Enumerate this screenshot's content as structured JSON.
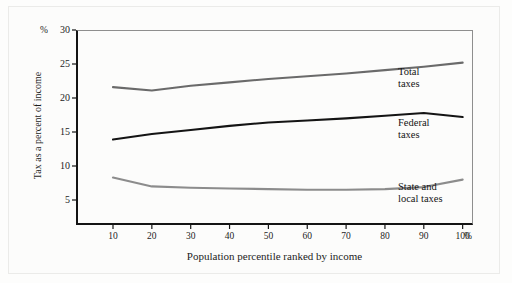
{
  "figure": {
    "background_color": "#fdfdfc",
    "frame_color": "#141414"
  },
  "axes": {
    "y_axis_unit": "%",
    "x_axis_unit": "%",
    "y_title": "Tax as a percent of income",
    "x_title": "Population percentile ranked by income",
    "y_ticks": [
      "30",
      "25",
      "20",
      "15",
      "10",
      "5"
    ],
    "x_ticks": [
      "10",
      "20",
      "30",
      "40",
      "50",
      "60",
      "70",
      "80",
      "90",
      "100"
    ]
  },
  "series_labels": {
    "total": "Total\ntaxes",
    "federal": "Federal\ntaxes",
    "state_local": "State and\nlocal taxes"
  },
  "chart_data": {
    "type": "line",
    "title": "",
    "xlabel": "Population percentile ranked by income",
    "ylabel": "Tax as a percent of income",
    "x": [
      10,
      20,
      30,
      40,
      50,
      60,
      70,
      80,
      90,
      100
    ],
    "xlim": [
      0,
      110
    ],
    "ylim": [
      0,
      30
    ],
    "yticks": [
      5,
      10,
      15,
      20,
      25,
      30
    ],
    "xticks": [
      10,
      20,
      30,
      40,
      50,
      60,
      70,
      80,
      90,
      100
    ],
    "grid": false,
    "legend_position": "right-inline",
    "series": [
      {
        "name": "Total taxes",
        "color": "#6a6a6a",
        "values": [
          21.6,
          21.1,
          21.8,
          22.3,
          22.8,
          23.2,
          23.6,
          24.1,
          24.6,
          25.2
        ]
      },
      {
        "name": "Federal taxes",
        "color": "#141414",
        "values": [
          13.9,
          14.7,
          15.3,
          15.9,
          16.4,
          16.7,
          17.0,
          17.4,
          17.8,
          17.2
        ]
      },
      {
        "name": "State and local taxes",
        "color": "#8c8c8c",
        "values": [
          8.3,
          7.0,
          6.8,
          6.7,
          6.6,
          6.5,
          6.5,
          6.6,
          6.9,
          8.0
        ]
      }
    ]
  }
}
